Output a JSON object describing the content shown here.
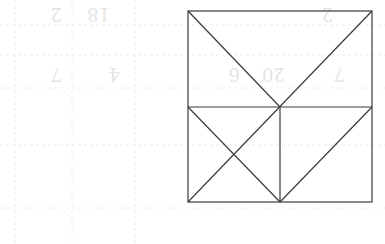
{
  "figure": {
    "stroke_color": "#3a3a3a",
    "background_color": "#ffffff",
    "outer_rect": {
      "x1": 188,
      "y1": 11,
      "x2": 372,
      "y2": 202
    },
    "mid_y": 107,
    "mid_x": 280,
    "segments": [
      {
        "name": "top-left-diagonal",
        "x1": 188,
        "y1": 11,
        "x2": 280,
        "y2": 107
      },
      {
        "name": "top-right-diagonal-long",
        "x1": 372,
        "y1": 11,
        "x2": 188,
        "y2": 202
      },
      {
        "name": "middle-horizontal",
        "x1": 188,
        "y1": 107,
        "x2": 372,
        "y2": 107
      },
      {
        "name": "middle-vertical",
        "x1": 280,
        "y1": 107,
        "x2": 280,
        "y2": 202
      },
      {
        "name": "lower-left-diagonal",
        "x1": 188,
        "y1": 107,
        "x2": 280,
        "y2": 202
      },
      {
        "name": "lower-right-diagonal",
        "x1": 280,
        "y1": 202,
        "x2": 372,
        "y2": 107
      }
    ]
  },
  "bleed_through": {
    "labels": [
      {
        "text": "2",
        "x": 62,
        "y": 20
      },
      {
        "text": "18",
        "x": 110,
        "y": 20
      },
      {
        "text": "2",
        "x": 333,
        "y": 20
      },
      {
        "text": "7",
        "x": 62,
        "y": 80
      },
      {
        "text": "4",
        "x": 120,
        "y": 80
      },
      {
        "text": "20",
        "x": 285,
        "y": 80
      },
      {
        "text": "6",
        "x": 240,
        "y": 80
      },
      {
        "text": "7",
        "x": 345,
        "y": 80
      }
    ]
  }
}
